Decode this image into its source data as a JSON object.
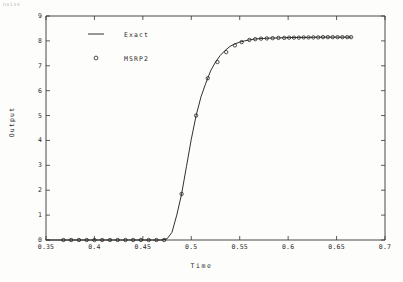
{
  "annotations": {
    "top_left_faint_text": "noise"
  },
  "chart_data": {
    "type": "line",
    "title": "",
    "xlabel": "Time",
    "ylabel": "Output",
    "xlim": [
      0.35,
      0.7
    ],
    "ylim": [
      0,
      9
    ],
    "xticks": [
      0.35,
      0.4,
      0.45,
      0.5,
      0.55,
      0.6,
      0.65,
      0.7
    ],
    "xtick_labels": [
      "0.35",
      "0.4",
      "0.45",
      "0.5",
      "0.55",
      "0.6",
      "0.65",
      "0.7"
    ],
    "yticks": [
      0,
      1,
      2,
      3,
      4,
      5,
      6,
      7,
      8,
      9
    ],
    "ytick_labels": [
      "0",
      "1",
      "2",
      "3",
      "4",
      "5",
      "6",
      "7",
      "8",
      "9"
    ],
    "grid": false,
    "legend_position": "upper left",
    "series": [
      {
        "name": "Exact",
        "style": "solid-line",
        "marker": "none",
        "color": "#1a1a1a",
        "x": [
          0.35,
          0.36,
          0.37,
          0.38,
          0.39,
          0.4,
          0.41,
          0.42,
          0.43,
          0.44,
          0.45,
          0.46,
          0.47,
          0.475,
          0.48,
          0.485,
          0.49,
          0.495,
          0.5,
          0.505,
          0.51,
          0.515,
          0.52,
          0.525,
          0.53,
          0.535,
          0.54,
          0.545,
          0.55,
          0.555,
          0.56,
          0.565,
          0.57,
          0.575,
          0.58,
          0.59,
          0.6,
          0.61,
          0.62,
          0.63,
          0.64,
          0.65,
          0.66,
          0.665
        ],
        "y": [
          0.0,
          0.0,
          0.0,
          0.0,
          0.0,
          0.0,
          0.0,
          0.0,
          0.0,
          0.0,
          0.0,
          0.0,
          0.0,
          0.05,
          0.3,
          1.0,
          1.85,
          2.95,
          4.05,
          5.0,
          5.75,
          6.3,
          6.8,
          7.15,
          7.42,
          7.62,
          7.78,
          7.88,
          7.95,
          8.0,
          8.04,
          8.07,
          8.09,
          8.1,
          8.11,
          8.12,
          8.13,
          8.14,
          8.14,
          8.15,
          8.15,
          8.15,
          8.15,
          8.15
        ]
      },
      {
        "name": "MSRP2",
        "style": "markers",
        "marker": "circle",
        "color": "#1a1a1a",
        "x": [
          0.368,
          0.376,
          0.384,
          0.392,
          0.4,
          0.408,
          0.416,
          0.424,
          0.432,
          0.44,
          0.448,
          0.456,
          0.464,
          0.472,
          0.49,
          0.505,
          0.517,
          0.527,
          0.536,
          0.545,
          0.552,
          0.56,
          0.566,
          0.572,
          0.578,
          0.584,
          0.59,
          0.596,
          0.601,
          0.606,
          0.611,
          0.616,
          0.621,
          0.626,
          0.631,
          0.636,
          0.641,
          0.646,
          0.651,
          0.656,
          0.661,
          0.665
        ],
        "y": [
          0.0,
          0.0,
          0.0,
          0.0,
          0.0,
          0.0,
          0.0,
          0.0,
          0.0,
          0.0,
          0.0,
          0.0,
          0.0,
          0.0,
          1.85,
          5.0,
          6.5,
          7.15,
          7.55,
          7.82,
          7.95,
          8.04,
          8.07,
          8.09,
          8.1,
          8.11,
          8.12,
          8.12,
          8.13,
          8.13,
          8.13,
          8.14,
          8.14,
          8.14,
          8.14,
          8.15,
          8.15,
          8.15,
          8.15,
          8.15,
          8.15,
          8.15
        ]
      }
    ],
    "legend": [
      {
        "label": "Exact",
        "marker": "line"
      },
      {
        "label": "MSRP2",
        "marker": "circle"
      }
    ]
  }
}
